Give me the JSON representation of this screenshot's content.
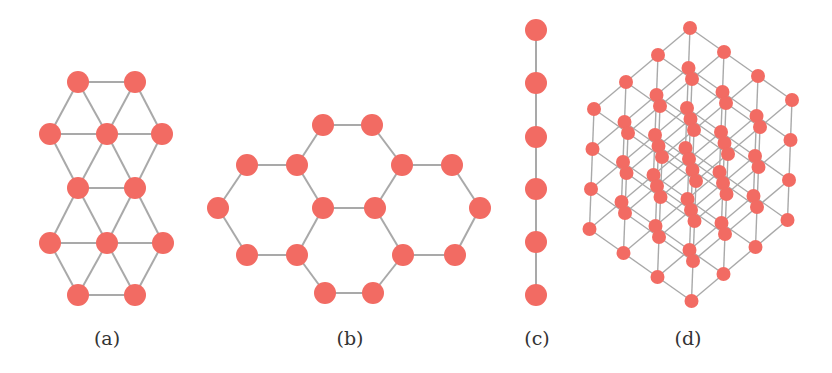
{
  "figure": {
    "node_color": "#f26b63",
    "edge_color": "#a9a9a9",
    "label_color": "#333333",
    "panels": [
      {
        "id": "a",
        "label": "(a)",
        "description": "triangular lattice",
        "label_x": 107,
        "nodes": [
          [
            78,
            82
          ],
          [
            135,
            82
          ],
          [
            50,
            134
          ],
          [
            107,
            134
          ],
          [
            162,
            134
          ],
          [
            78,
            188
          ],
          [
            135,
            188
          ],
          [
            50,
            243
          ],
          [
            107,
            243
          ],
          [
            163,
            243
          ],
          [
            78,
            295
          ],
          [
            135,
            295
          ]
        ],
        "edges": [
          [
            0,
            1
          ],
          [
            0,
            2
          ],
          [
            0,
            3
          ],
          [
            1,
            3
          ],
          [
            1,
            4
          ],
          [
            2,
            3
          ],
          [
            3,
            4
          ],
          [
            2,
            5
          ],
          [
            3,
            5
          ],
          [
            3,
            6
          ],
          [
            4,
            6
          ],
          [
            5,
            6
          ],
          [
            5,
            7
          ],
          [
            5,
            8
          ],
          [
            6,
            8
          ],
          [
            6,
            9
          ],
          [
            7,
            8
          ],
          [
            8,
            9
          ],
          [
            7,
            10
          ],
          [
            8,
            10
          ],
          [
            8,
            11
          ],
          [
            9,
            11
          ],
          [
            10,
            11
          ]
        ]
      },
      {
        "id": "b",
        "label": "(b)",
        "description": "honeycomb lattice",
        "label_x": 350,
        "nodes": [
          [
            323,
            125
          ],
          [
            372,
            125
          ],
          [
            247,
            165
          ],
          [
            297,
            165
          ],
          [
            402,
            165
          ],
          [
            452,
            165
          ],
          [
            218,
            208
          ],
          [
            323,
            208
          ],
          [
            375,
            208
          ],
          [
            480,
            208
          ],
          [
            247,
            255
          ],
          [
            297,
            255
          ],
          [
            403,
            255
          ],
          [
            455,
            255
          ],
          [
            325,
            293
          ],
          [
            373,
            293
          ]
        ],
        "edges": [
          [
            0,
            1
          ],
          [
            0,
            3
          ],
          [
            1,
            4
          ],
          [
            2,
            3
          ],
          [
            2,
            6
          ],
          [
            3,
            7
          ],
          [
            4,
            5
          ],
          [
            4,
            8
          ],
          [
            5,
            9
          ],
          [
            6,
            10
          ],
          [
            7,
            8
          ],
          [
            7,
            11
          ],
          [
            8,
            12
          ],
          [
            9,
            13
          ],
          [
            10,
            11
          ],
          [
            11,
            14
          ],
          [
            12,
            13
          ],
          [
            12,
            15
          ],
          [
            14,
            15
          ]
        ]
      },
      {
        "id": "c",
        "label": "(c)",
        "description": "linear chain",
        "label_x": 537,
        "nodes": [
          [
            536,
            30
          ],
          [
            536,
            83
          ],
          [
            536,
            137
          ],
          [
            536,
            189
          ],
          [
            536,
            242
          ],
          [
            536,
            295
          ]
        ],
        "edges": [
          [
            0,
            1
          ],
          [
            1,
            2
          ],
          [
            2,
            3
          ],
          [
            3,
            4
          ],
          [
            4,
            5
          ]
        ]
      },
      {
        "id": "d",
        "label": "(d)",
        "description": "simple cubic lattice 4x4x4",
        "label_x": 688,
        "cubic": {
          "size": 4,
          "origin": [
            690,
            28
          ],
          "a": [
            -32,
            27
          ],
          "b": [
            34,
            24
          ],
          "c": [
            -1.5,
            40
          ]
        }
      }
    ]
  }
}
